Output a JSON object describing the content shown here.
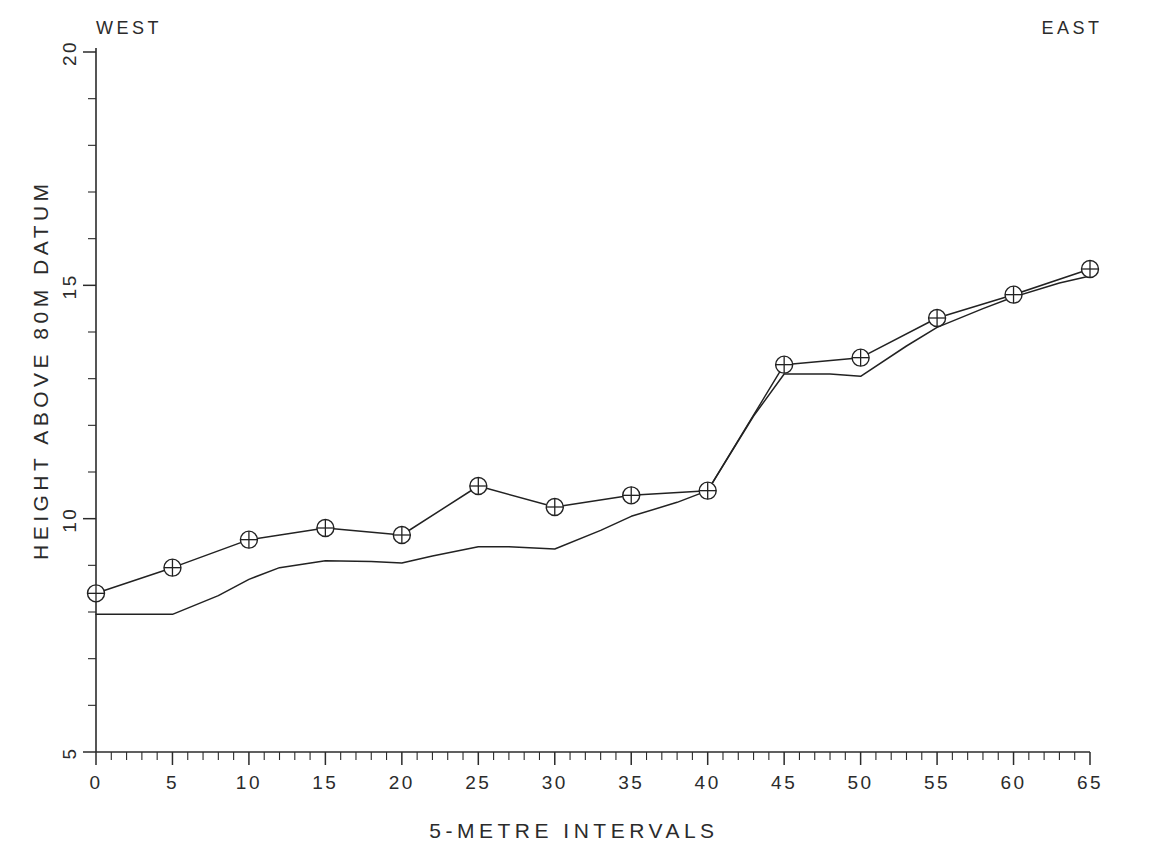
{
  "labels": {
    "west": "WEST",
    "east": "EAST",
    "y_axis_title": "HEIGHT ABOVE 80M DATUM",
    "x_axis_title": "5-METRE INTERVALS"
  },
  "chart_data": {
    "type": "line",
    "title": "",
    "xlabel": "5-METRE INTERVALS",
    "ylabel": "HEIGHT ABOVE 80M DATUM",
    "xlim": [
      0,
      65
    ],
    "ylim": [
      5,
      20
    ],
    "grid": false,
    "legend": "none",
    "x_tick_labels": [
      "0",
      "5",
      "10",
      "15",
      "20",
      "25",
      "30",
      "35",
      "40",
      "45",
      "50",
      "55",
      "60",
      "65"
    ],
    "x_ticks": [
      0,
      5,
      10,
      15,
      20,
      25,
      30,
      35,
      40,
      45,
      50,
      55,
      60,
      65
    ],
    "x_minor_step": 1,
    "y_tick_labels": [
      "5",
      "10",
      "15",
      "20"
    ],
    "y_ticks": [
      5,
      10,
      15,
      20
    ],
    "y_minor_step": 1,
    "annotations": [
      {
        "text": "WEST",
        "position": "top-left"
      },
      {
        "text": "EAST",
        "position": "top-right"
      }
    ],
    "x": [
      0,
      5,
      10,
      15,
      20,
      25,
      30,
      35,
      40,
      45,
      50,
      55,
      60,
      65
    ],
    "series": [
      {
        "name": "surveyed-surface",
        "marker": "circle-plus",
        "values": [
          8.4,
          8.95,
          9.55,
          9.8,
          9.65,
          10.7,
          10.25,
          10.5,
          10.6,
          13.3,
          13.45,
          14.3,
          14.8,
          15.35
        ]
      },
      {
        "name": "reference-profile",
        "marker": "none",
        "x": [
          0,
          2,
          5,
          8,
          10,
          12,
          15,
          18,
          20,
          22,
          25,
          27,
          30,
          33,
          35,
          38,
          40,
          43,
          45,
          48,
          50,
          53,
          55,
          58,
          60,
          63,
          65
        ],
        "values": [
          7.95,
          7.95,
          7.95,
          8.35,
          8.7,
          8.95,
          9.1,
          9.08,
          9.05,
          9.2,
          9.4,
          9.4,
          9.35,
          9.75,
          10.05,
          10.35,
          10.6,
          12.2,
          13.1,
          13.1,
          13.05,
          13.7,
          14.1,
          14.5,
          14.75,
          15.05,
          15.2
        ]
      }
    ]
  }
}
